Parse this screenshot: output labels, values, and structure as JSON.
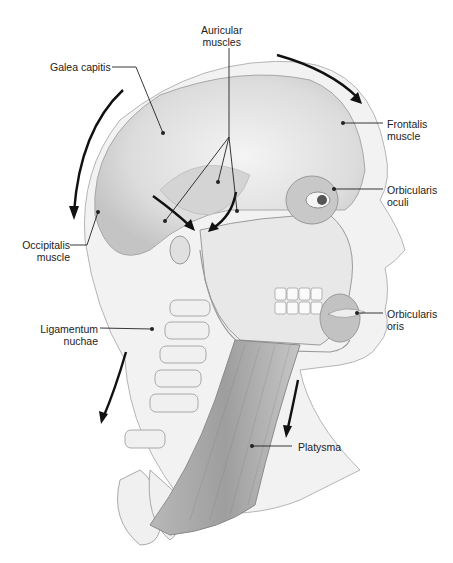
{
  "figure": {
    "colors": {
      "ink": "#222222",
      "muscle": "#c8c8c8",
      "bone": "#ececec",
      "outline": "#9a9a9a",
      "arrow": "#111111"
    }
  },
  "labels": {
    "auricular": [
      "Auricular",
      "muscles"
    ],
    "galea": [
      "Galea capitis"
    ],
    "frontalis": [
      "Frontalis",
      "muscle"
    ],
    "orbicularis_oculi": [
      "Orbicularis",
      "oculi"
    ],
    "occipitalis": [
      "Occipitalis",
      "muscle"
    ],
    "orbicularis_oris": [
      "Orbicularis",
      "oris"
    ],
    "ligamentum": [
      "Ligamentum",
      "nuchae"
    ],
    "platysma": [
      "Platysma"
    ]
  }
}
